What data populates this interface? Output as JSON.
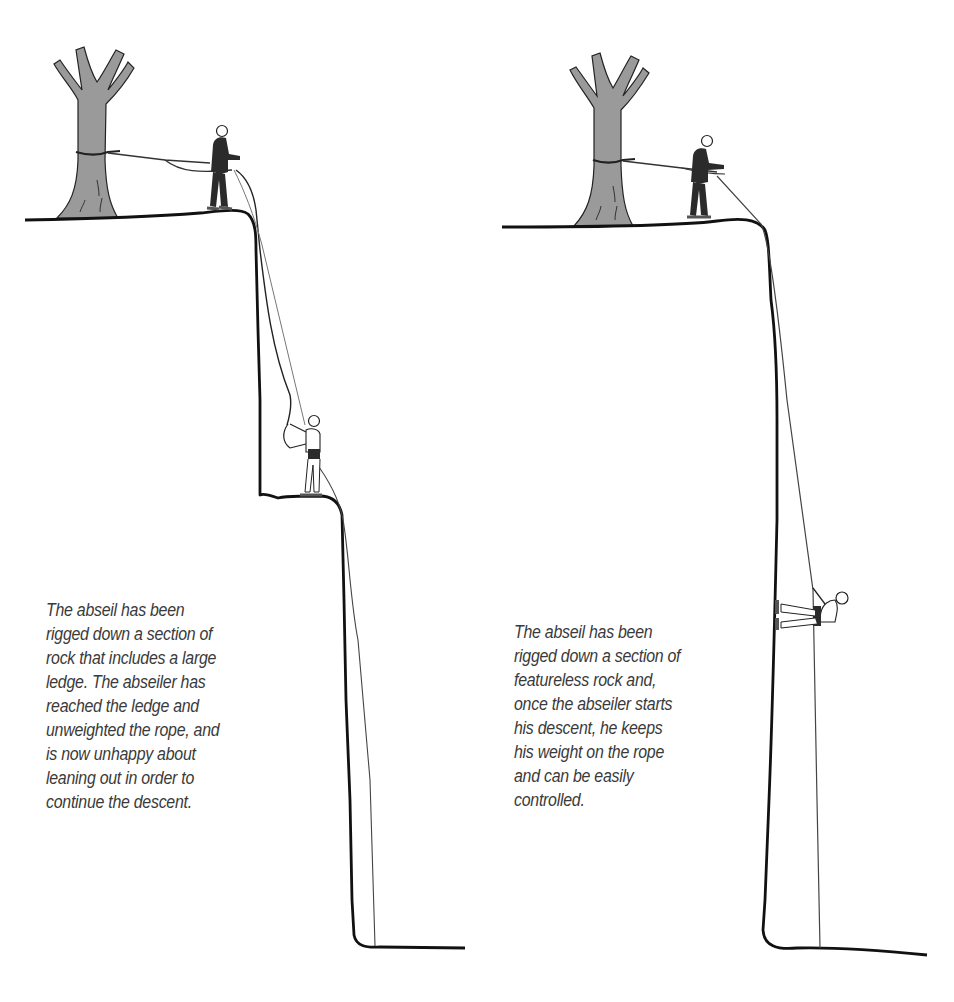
{
  "figure": {
    "panels": [
      {
        "id": "ledge-scenario",
        "caption_lines": [
          "The abseil has been",
          "rigged down a section of",
          "rock that includes a large",
          "ledge. The abseiler has",
          "reached the ledge and",
          "unweighted the rope, and",
          "is now unhappy about",
          "leaning out in order to",
          "continue the descent."
        ]
      },
      {
        "id": "featureless-scenario",
        "caption_lines": [
          "The abseil has been",
          "rigged down a section of",
          "featureless rock and,",
          "once the abseiler starts",
          "his descent, he keeps",
          "his weight on the rope",
          "and can be easily",
          "controlled."
        ]
      }
    ],
    "colors": {
      "line": "#111111",
      "tree_fill": "#9a9a9a",
      "figure_dark": "#2b2b2b",
      "rope_thin": "#555555",
      "text": "#3a3a3a"
    }
  }
}
